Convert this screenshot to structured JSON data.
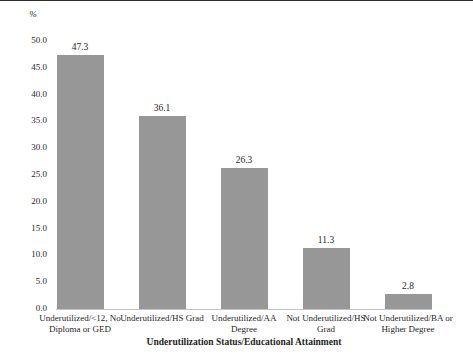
{
  "chart_data": {
    "type": "bar",
    "title": "",
    "ylabel": "%",
    "xlabel": "Underutilization Status/Educational Attainment",
    "categories": [
      "Underutilized/<12, No Diploma or GED",
      "Underutilized/HS Grad",
      "Underutilized/AA Degree",
      "Not Underutilized/HS Grad",
      "Not Underutilized/BA or Higher Degree"
    ],
    "category_lines": [
      [
        "Underutilized/<12, No",
        "Diploma or GED"
      ],
      [
        "Underutilized/HS Grad"
      ],
      [
        "Underutilized/AA",
        "Degree"
      ],
      [
        "Not Underutilized/HS",
        "Grad"
      ],
      [
        "Not Underutilized/BA or",
        "Higher Degree"
      ]
    ],
    "values": [
      47.3,
      36.1,
      26.3,
      11.3,
      2.8
    ],
    "value_labels": [
      "47.3",
      "36.1",
      "26.3",
      "11.3",
      "2.8"
    ],
    "ylim": [
      0,
      50
    ],
    "ytick_values": [
      50,
      45,
      40,
      35,
      30,
      25,
      20,
      15,
      10,
      5,
      0
    ],
    "ytick_labels": [
      "50.0",
      "45.0",
      "40.0",
      "35.0",
      "30.0",
      "25.0",
      "20.0",
      "15.0",
      "10.0",
      "5.0",
      "0.0"
    ],
    "grid": false,
    "legend": null,
    "bar_color": "#979797",
    "axis_line_color": "#c3c3c3",
    "text_color": "#1f1f1f"
  }
}
